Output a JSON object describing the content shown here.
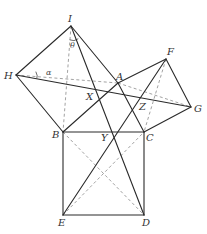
{
  "diagram": {
    "points": {
      "I": {
        "x": 71,
        "y": 26,
        "label": "I"
      },
      "H": {
        "x": 16,
        "y": 75,
        "label": "H"
      },
      "A": {
        "x": 118,
        "y": 83,
        "label": "A"
      },
      "F": {
        "x": 166,
        "y": 59,
        "label": "F"
      },
      "G": {
        "x": 191,
        "y": 107,
        "label": "G"
      },
      "B": {
        "x": 63,
        "y": 132,
        "label": "B"
      },
      "C": {
        "x": 144,
        "y": 132,
        "label": "C"
      },
      "E": {
        "x": 63,
        "y": 215,
        "label": "E"
      },
      "D": {
        "x": 144,
        "y": 215,
        "label": "D"
      },
      "X": {
        "label": "X"
      },
      "Y": {
        "label": "Y"
      },
      "Z": {
        "label": "Z"
      }
    },
    "angles": {
      "theta": "θ",
      "alpha": "α"
    }
  }
}
